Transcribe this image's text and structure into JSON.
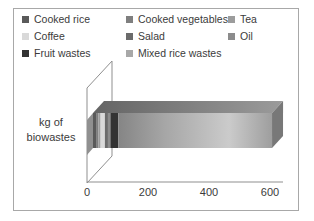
{
  "figure": {
    "background": "#ffffff",
    "frame_border_color": "#a8a8a8"
  },
  "y_axis": {
    "label_line1": "kg of",
    "label_line2": "biowastes"
  },
  "chart_data": {
    "type": "bar",
    "orientation": "horizontal",
    "stacked": true,
    "style": "3d",
    "title": "",
    "xlabel": "",
    "ylabel": "kg of biowastes",
    "categories": [
      "kg of biowastes"
    ],
    "series": [
      {
        "name": "Cooked rice",
        "values": [
          10
        ],
        "color": "#5a5a5a"
      },
      {
        "name": "Cooked vegetables",
        "values": [
          8
        ],
        "color": "#7f7f7f"
      },
      {
        "name": "Tea",
        "values": [
          7
        ],
        "color": "#9c9c9c"
      },
      {
        "name": "Coffee",
        "values": [
          14
        ],
        "color": "#d9d9d9"
      },
      {
        "name": "Salad",
        "values": [
          10
        ],
        "color": "#6b6b6b"
      },
      {
        "name": "Oil",
        "values": [
          8
        ],
        "color": "#8c8c8c"
      },
      {
        "name": "Fruit wastes",
        "values": [
          26
        ],
        "color": "#333333"
      },
      {
        "name": "Mixed rice wastes",
        "values": [
          504
        ],
        "color": "#a8a8a8"
      }
    ],
    "xlim": [
      0,
      600
    ],
    "xticks": [
      0,
      200,
      400,
      600
    ],
    "gridlines": false,
    "legend_position": "top"
  }
}
